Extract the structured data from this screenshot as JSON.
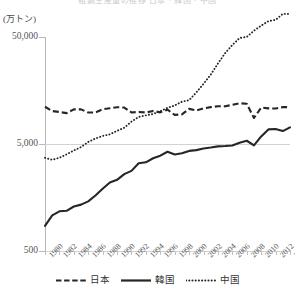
{
  "header": {
    "cutoff_title": "粗鋼生産量の推移  日本・韓国・中国",
    "unit_label": "(万トン)"
  },
  "axes": {
    "y_ticks": [
      "50,000",
      "5,000",
      "500"
    ],
    "y_values": [
      50000,
      5000,
      500
    ],
    "x_ticks": [
      "1980",
      "1982",
      "1984",
      "1986",
      "1988",
      "1990",
      "1992",
      "1994",
      "1996",
      "1998",
      "2000",
      "2002",
      "2004",
      "2006",
      "2008",
      "2010",
      "2012",
      "2014"
    ]
  },
  "legend": {
    "items": [
      {
        "label": "日本",
        "style": "dashed",
        "color": "#262626"
      },
      {
        "label": "韓国",
        "style": "solid",
        "color": "#262626"
      },
      {
        "label": "中国",
        "style": "dotted",
        "color": "#262626"
      }
    ]
  },
  "chart_data": {
    "type": "line",
    "title": "粗鋼生産量の推移  日本・韓国・中国",
    "xlabel": "",
    "ylabel": "(万トン)",
    "yscale": "log",
    "ylim": [
      500,
      50000
    ],
    "grid": true,
    "legend_position": "bottom",
    "x": [
      1980,
      1981,
      1982,
      1983,
      1984,
      1985,
      1986,
      1987,
      1988,
      1989,
      1990,
      1991,
      1992,
      1993,
      1994,
      1995,
      1996,
      1997,
      1998,
      1999,
      2000,
      2001,
      2002,
      2003,
      2004,
      2005,
      2006,
      2007,
      2008,
      2009,
      2010,
      2011,
      2012,
      2013,
      2014
    ],
    "series": [
      {
        "name": "日本",
        "style": "dashed",
        "values": [
          11141,
          10167,
          9955,
          9718,
          10542,
          10530,
          9837,
          9851,
          10562,
          10785,
          11034,
          10964,
          9861,
          9962,
          9859,
          10164,
          9880,
          10455,
          9355,
          9455,
          10644,
          10286,
          10775,
          11051,
          11272,
          11247,
          11622,
          12020,
          11874,
          8753,
          10960,
          10760,
          10724,
          11059,
          11066
        ]
      },
      {
        "name": "韓国",
        "style": "solid",
        "values": [
          858,
          1076,
          1175,
          1187,
          1303,
          1356,
          1456,
          1649,
          1911,
          2187,
          2312,
          2612,
          2805,
          3305,
          3372,
          3677,
          3890,
          4234,
          3990,
          4104,
          4310,
          4385,
          4539,
          4631,
          4752,
          4782,
          4845,
          5147,
          5362,
          4857,
          5891,
          6847,
          6907,
          6606,
          7154
        ]
      },
      {
        "name": "中国",
        "style": "dotted",
        "values": [
          3712,
          3560,
          3716,
          4002,
          4346,
          4679,
          5221,
          5628,
          5943,
          6159,
          6635,
          7100,
          8094,
          8954,
          9261,
          9536,
          10124,
          10891,
          11459,
          12426,
          12850,
          15163,
          18237,
          22234,
          28292,
          35324,
          42102,
          48929,
          50048,
          57218,
          63874,
          70278,
          72388,
          82199,
          82270
        ]
      }
    ]
  }
}
